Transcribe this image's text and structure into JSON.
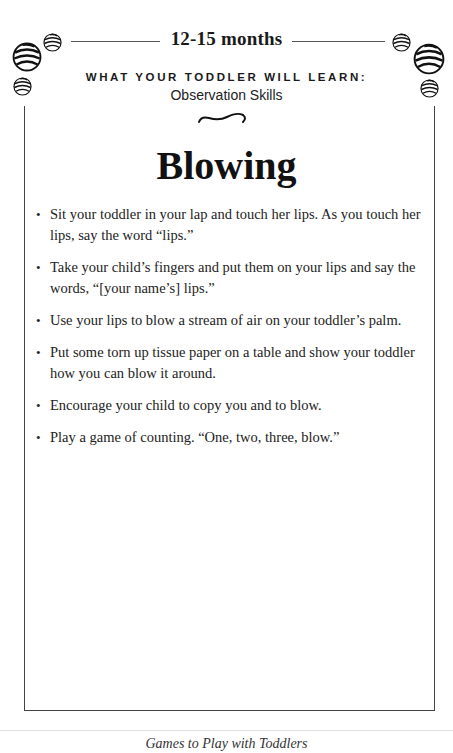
{
  "header": {
    "age_range": "12-15 months",
    "learn_label": "WHAT YOUR TODDLER WILL LEARN:",
    "skill": "Observation Skills"
  },
  "activity": {
    "title": "Blowing",
    "steps": [
      "Sit your toddler in your lap and touch her lips. As you touch her lips, say the word “lips.”",
      "Take your child’s fingers and put them on your lips and say the words, “[your name’s] lips.”",
      "Use your lips to blow a stream of air on your toddler’s palm.",
      "Put some torn up tissue paper on a table and show your toddler how you can blow it around.",
      "Encourage your child to copy you and to blow.",
      "Play a game of counting. “One, two, three, blow.”"
    ]
  },
  "footer": {
    "book_title": "Games to Play with Toddlers"
  },
  "decorations": {
    "corner_icon": "striped-ball-icon",
    "divider_icon": "swash-ornament-icon"
  }
}
